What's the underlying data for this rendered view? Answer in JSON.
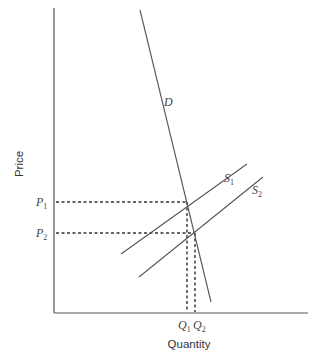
{
  "diagram": {
    "type": "supply-demand",
    "x_axis": {
      "label": "Quantity"
    },
    "y_axis": {
      "label": "Price"
    },
    "curves": [
      {
        "id": "D",
        "label": "D",
        "sub": ""
      },
      {
        "id": "S1",
        "label": "S",
        "sub": "1"
      },
      {
        "id": "S2",
        "label": "S",
        "sub": "2"
      }
    ],
    "price_levels": [
      {
        "label": "P",
        "sub": "1"
      },
      {
        "label": "P",
        "sub": "2"
      }
    ],
    "quantity_levels": [
      {
        "label": "Q",
        "sub": "1"
      },
      {
        "label": "Q",
        "sub": "2"
      }
    ],
    "colors": {
      "line": "#555555",
      "guide": "#333333",
      "background": "#ffffff"
    }
  }
}
